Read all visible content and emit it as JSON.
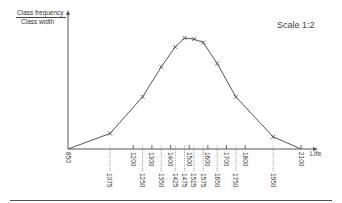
{
  "chart_data": {
    "type": "line",
    "title": "",
    "annotation": "Scale 1:2",
    "xlabel": "Life",
    "ylabel": [
      "Class frequency",
      "Class width"
    ],
    "grid": false,
    "x_axis_origin_label": "850",
    "class_boundaries": [
      850,
      1200,
      1300,
      1400,
      1500,
      1600,
      1700,
      1800,
      2100
    ],
    "boundary_labels_above": [
      "1200",
      "1300",
      "1400",
      "1500",
      "1600",
      "1700",
      "1800",
      "2100"
    ],
    "class_midpoints": [
      1075,
      1250,
      1350,
      1425,
      1475,
      1525,
      1575,
      1650,
      1750,
      1950
    ],
    "midpoint_labels_below": [
      "1075",
      "1250",
      "1350",
      "1425",
      "1475",
      "1525",
      "1575",
      "1650",
      "1750",
      "1950"
    ],
    "series": [
      {
        "name": "Frequency polygon (class frequency / class width)",
        "x": [
          850,
          1075,
          1250,
          1350,
          1425,
          1475,
          1525,
          1575,
          1650,
          1750,
          1950,
          2100
        ],
        "values_relative": [
          0,
          0.14,
          0.47,
          0.74,
          0.92,
          1.0,
          0.99,
          0.96,
          0.77,
          0.47,
          0.11,
          0
        ],
        "marker": "x"
      }
    ],
    "xlim": [
      850,
      2150
    ],
    "ylim": [
      0,
      1.25
    ]
  },
  "labels": {
    "ylabel_top": "Class frequency",
    "ylabel_bottom": "Class width",
    "scale": "Scale 1:2",
    "xlabel": "Life"
  }
}
